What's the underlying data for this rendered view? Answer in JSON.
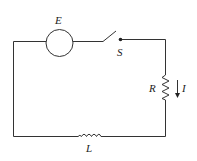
{
  "diagram": {
    "type": "RL circuit with switch",
    "components": {
      "source": {
        "label": "E",
        "symbol": "circle-source"
      },
      "switch": {
        "label": "S",
        "state": "open"
      },
      "resistor": {
        "label": "R"
      },
      "inductor": {
        "label": "L"
      },
      "current": {
        "label": "I",
        "direction": "down"
      }
    },
    "colors": {
      "wire": "#333333",
      "text": "#222222",
      "background": "#ffffff"
    }
  }
}
